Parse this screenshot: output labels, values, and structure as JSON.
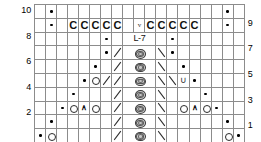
{
  "chart_title": "",
  "chart_data": {
    "type": "table",
    "title": "",
    "subtitle": "",
    "xlabel": "",
    "ylabel": "",
    "grid": true,
    "columns": 19,
    "rows": 10,
    "center_label": "L-7",
    "legend_position": "none",
    "row_labels_left": [
      "10",
      "",
      "8",
      "",
      "6",
      "",
      "4",
      "",
      "2",
      ""
    ],
    "row_labels_right": [
      "",
      "9",
      "",
      "7",
      "",
      "5",
      "",
      "3",
      "",
      "1"
    ],
    "symbols_legend": {
      "dot": "purl",
      "o": "yarn-over",
      "c": "cable-cross",
      "v": "slip-stitch",
      "bs": "left-leaning-decrease",
      "fs": "right-leaning-decrease",
      "up": "centered-double-decrease",
      "u": "knit-below",
      "oval": "bobble",
      "oval-flat": "bobble-flat",
      "g": "no-stitch-gray",
      "blank": "knit"
    },
    "cells": [
      [
        "g",
        "dot",
        "blank",
        "blank",
        "blank",
        "blank",
        "blank",
        "blank",
        "blank",
        "blank",
        "blank",
        "blank",
        "blank",
        "blank",
        "blank",
        "blank",
        "blank",
        "dot",
        "g"
      ],
      [
        "g",
        "dot",
        "blank",
        "c",
        "c",
        "c",
        "c",
        "c",
        "g",
        "v",
        "c",
        "c",
        "c",
        "c",
        "c",
        "blank",
        "blank",
        "dot",
        "g"
      ],
      [
        "g",
        "g",
        "g",
        "g",
        "g",
        "g",
        "dot",
        "blank",
        "L7",
        "L7",
        "L7",
        "blank",
        "dot",
        "g",
        "g",
        "g",
        "g",
        "g",
        "g"
      ],
      [
        "g",
        "g",
        "g",
        "g",
        "g",
        "g",
        "dot",
        "bs",
        "oval",
        "oval",
        "oval",
        "fs",
        "dot",
        "g",
        "g",
        "g",
        "g",
        "g",
        "g"
      ],
      [
        "g",
        "g",
        "g",
        "g",
        "g",
        "dot",
        "blank",
        "bs",
        "oval",
        "oval",
        "oval",
        "fs",
        "blank",
        "dot",
        "g",
        "g",
        "g",
        "g",
        "g"
      ],
      [
        "g",
        "g",
        "g",
        "g",
        "dot",
        "o",
        "bs",
        "bs",
        "oval-flat",
        "oval-flat",
        "oval-flat",
        "fs",
        "fs",
        "u",
        "dot",
        "g",
        "g",
        "g",
        "g"
      ],
      [
        "g",
        "g",
        "g",
        "dot",
        "blank",
        "blank",
        "blank",
        "bs",
        "oval",
        "oval",
        "oval",
        "fs",
        "blank",
        "blank",
        "blank",
        "dot",
        "g",
        "g",
        "g"
      ],
      [
        "g",
        "g",
        "dot",
        "o",
        "up",
        "o",
        "blank",
        "bs",
        "oval",
        "oval",
        "oval",
        "fs",
        "blank",
        "o",
        "up",
        "o",
        "dot",
        "g",
        "g"
      ],
      [
        "g",
        "dot",
        "blank",
        "blank",
        "blank",
        "blank",
        "blank",
        "bs",
        "oval",
        "oval",
        "oval",
        "fs",
        "blank",
        "blank",
        "blank",
        "blank",
        "blank",
        "dot",
        "g"
      ],
      [
        "dot",
        "o",
        "blank",
        "blank",
        "blank",
        "blank",
        "blank",
        "bs",
        "oval",
        "oval",
        "oval",
        "fs",
        "blank",
        "blank",
        "blank",
        "blank",
        "blank",
        "o",
        "dot"
      ]
    ]
  }
}
